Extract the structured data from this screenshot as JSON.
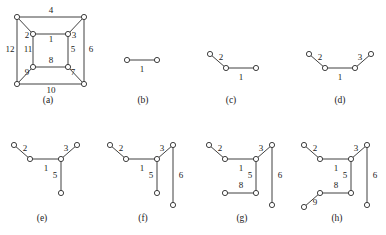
{
  "figure": {
    "style": {
      "stroke_color": "#2b2b2b",
      "node_fill": "#ffffff",
      "text_color": "#1a1a1a",
      "background": "#ffffff",
      "node_radius": 2.6
    },
    "panels": [
      {
        "id": "a",
        "caption": "(a)",
        "caption_pos": [
          48,
          101
        ],
        "nodes": [
          [
            17,
            17
          ],
          [
            84,
            17
          ],
          [
            17,
            84
          ],
          [
            84,
            84
          ],
          [
            33,
            34
          ],
          [
            68,
            34
          ],
          [
            33,
            67
          ],
          [
            68,
            67
          ]
        ],
        "edges": [
          {
            "from": [
              17,
              17
            ],
            "to": [
              84,
              17
            ]
          },
          {
            "from": [
              17,
              17
            ],
            "to": [
              17,
              84
            ]
          },
          {
            "from": [
              84,
              17
            ],
            "to": [
              84,
              84
            ]
          },
          {
            "from": [
              17,
              84
            ],
            "to": [
              84,
              84
            ]
          },
          {
            "from": [
              33,
              34
            ],
            "to": [
              68,
              34
            ]
          },
          {
            "from": [
              33,
              34
            ],
            "to": [
              33,
              67
            ]
          },
          {
            "from": [
              68,
              34
            ],
            "to": [
              68,
              67
            ]
          },
          {
            "from": [
              33,
              67
            ],
            "to": [
              68,
              67
            ]
          },
          {
            "from": [
              17,
              17
            ],
            "to": [
              33,
              34
            ]
          },
          {
            "from": [
              84,
              17
            ],
            "to": [
              68,
              34
            ]
          },
          {
            "from": [
              17,
              84
            ],
            "to": [
              33,
              67
            ]
          },
          {
            "from": [
              84,
              84
            ],
            "to": [
              68,
              67
            ]
          }
        ],
        "labels": [
          {
            "text": "4",
            "pos": [
              51,
              11
            ]
          },
          {
            "text": "12",
            "pos": [
              10,
              50
            ]
          },
          {
            "text": "6",
            "pos": [
              91,
              50
            ]
          },
          {
            "text": "10",
            "pos": [
              51,
              91
            ]
          },
          {
            "text": "2",
            "pos": [
              27,
              36
            ]
          },
          {
            "text": "3",
            "pos": [
              74,
              36
            ]
          },
          {
            "text": "1",
            "pos": [
              51,
              40
            ]
          },
          {
            "text": "11",
            "pos": [
              28,
              50
            ]
          },
          {
            "text": "5",
            "pos": [
              73,
              50
            ]
          },
          {
            "text": "8",
            "pos": [
              51,
              61
            ]
          },
          {
            "text": "9",
            "pos": [
              27,
              73
            ]
          },
          {
            "text": "7",
            "pos": [
              73,
              73
            ]
          }
        ]
      },
      {
        "id": "b",
        "caption": "(b)",
        "caption_pos": [
          143,
          101
        ],
        "nodes": [
          [
            127,
            60
          ],
          [
            157,
            60
          ]
        ],
        "edges": [
          {
            "from": [
              127,
              60
            ],
            "to": [
              157,
              60
            ]
          }
        ],
        "labels": [
          {
            "text": "1",
            "pos": [
              142,
              70
            ]
          }
        ]
      },
      {
        "id": "c",
        "caption": "(c)",
        "caption_pos": [
          231,
          101
        ],
        "nodes": [
          [
            210,
            54
          ],
          [
            226,
            68
          ],
          [
            256,
            68
          ]
        ],
        "edges": [
          {
            "from": [
              210,
              54
            ],
            "to": [
              226,
              68
            ]
          },
          {
            "from": [
              226,
              68
            ],
            "to": [
              256,
              68
            ]
          }
        ],
        "labels": [
          {
            "text": "2",
            "pos": [
              221,
              58
            ]
          },
          {
            "text": "1",
            "pos": [
              241,
              78
            ]
          }
        ]
      },
      {
        "id": "d",
        "caption": "(d)",
        "caption_pos": [
          340,
          101
        ],
        "nodes": [
          [
            309,
            54
          ],
          [
            325,
            68
          ],
          [
            355,
            68
          ],
          [
            371,
            54
          ]
        ],
        "edges": [
          {
            "from": [
              309,
              54
            ],
            "to": [
              325,
              68
            ]
          },
          {
            "from": [
              325,
              68
            ],
            "to": [
              355,
              68
            ]
          },
          {
            "from": [
              355,
              68
            ],
            "to": [
              371,
              54
            ]
          }
        ],
        "labels": [
          {
            "text": "2",
            "pos": [
              320,
              58
            ]
          },
          {
            "text": "1",
            "pos": [
              340,
              78
            ]
          },
          {
            "text": "3",
            "pos": [
              360,
              58
            ]
          }
        ]
      },
      {
        "id": "e",
        "caption": "(e)",
        "caption_pos": [
          42,
          219
        ],
        "nodes": [
          [
            14,
            145
          ],
          [
            30,
            159
          ],
          [
            61,
            159
          ],
          [
            77,
            145
          ],
          [
            61,
            193
          ]
        ],
        "edges": [
          {
            "from": [
              14,
              145
            ],
            "to": [
              30,
              159
            ]
          },
          {
            "from": [
              30,
              159
            ],
            "to": [
              61,
              159
            ]
          },
          {
            "from": [
              61,
              159
            ],
            "to": [
              77,
              145
            ]
          },
          {
            "from": [
              61,
              159
            ],
            "to": [
              61,
              193
            ]
          }
        ],
        "labels": [
          {
            "text": "2",
            "pos": [
              25,
              149
            ]
          },
          {
            "text": "1",
            "pos": [
              46,
              169
            ]
          },
          {
            "text": "3",
            "pos": [
              66,
              149
            ]
          },
          {
            "text": "5",
            "pos": [
              55,
              176
            ]
          }
        ]
      },
      {
        "id": "f",
        "caption": "(f)",
        "caption_pos": [
          143,
          219
        ],
        "nodes": [
          [
            110,
            145
          ],
          [
            126,
            159
          ],
          [
            157,
            159
          ],
          [
            173,
            145
          ],
          [
            157,
            193
          ],
          [
            173,
            205
          ]
        ],
        "edges": [
          {
            "from": [
              110,
              145
            ],
            "to": [
              126,
              159
            ]
          },
          {
            "from": [
              126,
              159
            ],
            "to": [
              157,
              159
            ]
          },
          {
            "from": [
              157,
              159
            ],
            "to": [
              173,
              145
            ]
          },
          {
            "from": [
              157,
              159
            ],
            "to": [
              157,
              193
            ]
          },
          {
            "from": [
              173,
              145
            ],
            "to": [
              173,
              205
            ]
          }
        ],
        "labels": [
          {
            "text": "2",
            "pos": [
              121,
              149
            ]
          },
          {
            "text": "1",
            "pos": [
              142,
              169
            ]
          },
          {
            "text": "3",
            "pos": [
              162,
              149
            ]
          },
          {
            "text": "5",
            "pos": [
              151,
              176
            ]
          },
          {
            "text": "6",
            "pos": [
              181,
              176
            ]
          }
        ]
      },
      {
        "id": "g",
        "caption": "(g)",
        "caption_pos": [
          242,
          219
        ],
        "nodes": [
          [
            209,
            145
          ],
          [
            225,
            159
          ],
          [
            256,
            159
          ],
          [
            272,
            145
          ],
          [
            256,
            193
          ],
          [
            225,
            193
          ],
          [
            272,
            205
          ]
        ],
        "edges": [
          {
            "from": [
              209,
              145
            ],
            "to": [
              225,
              159
            ]
          },
          {
            "from": [
              225,
              159
            ],
            "to": [
              256,
              159
            ]
          },
          {
            "from": [
              256,
              159
            ],
            "to": [
              272,
              145
            ]
          },
          {
            "from": [
              256,
              159
            ],
            "to": [
              256,
              193
            ]
          },
          {
            "from": [
              272,
              145
            ],
            "to": [
              272,
              205
            ]
          },
          {
            "from": [
              225,
              193
            ],
            "to": [
              256,
              193
            ]
          }
        ],
        "labels": [
          {
            "text": "2",
            "pos": [
              220,
              149
            ]
          },
          {
            "text": "1",
            "pos": [
              241,
              169
            ]
          },
          {
            "text": "3",
            "pos": [
              261,
              149
            ]
          },
          {
            "text": "5",
            "pos": [
              250,
              176
            ]
          },
          {
            "text": "6",
            "pos": [
              280,
              176
            ]
          },
          {
            "text": "8",
            "pos": [
              241,
              186
            ]
          }
        ]
      },
      {
        "id": "h",
        "caption": "(h)",
        "caption_pos": [
          337,
          219
        ],
        "nodes": [
          [
            304,
            145
          ],
          [
            320,
            159
          ],
          [
            351,
            159
          ],
          [
            367,
            145
          ],
          [
            351,
            193
          ],
          [
            320,
            193
          ],
          [
            304,
            207
          ],
          [
            367,
            205
          ]
        ],
        "edges": [
          {
            "from": [
              304,
              145
            ],
            "to": [
              320,
              159
            ]
          },
          {
            "from": [
              320,
              159
            ],
            "to": [
              351,
              159
            ]
          },
          {
            "from": [
              351,
              159
            ],
            "to": [
              367,
              145
            ]
          },
          {
            "from": [
              351,
              159
            ],
            "to": [
              351,
              193
            ]
          },
          {
            "from": [
              367,
              145
            ],
            "to": [
              367,
              205
            ]
          },
          {
            "from": [
              320,
              193
            ],
            "to": [
              351,
              193
            ]
          },
          {
            "from": [
              320,
              193
            ],
            "to": [
              304,
              207
            ]
          }
        ],
        "labels": [
          {
            "text": "2",
            "pos": [
              315,
              149
            ]
          },
          {
            "text": "1",
            "pos": [
              336,
              169
            ]
          },
          {
            "text": "3",
            "pos": [
              356,
              149
            ]
          },
          {
            "text": "5",
            "pos": [
              345,
              176
            ]
          },
          {
            "text": "6",
            "pos": [
              375,
              176
            ]
          },
          {
            "text": "8",
            "pos": [
              336,
              186
            ]
          },
          {
            "text": "9",
            "pos": [
              315,
              203
            ]
          }
        ]
      }
    ]
  }
}
